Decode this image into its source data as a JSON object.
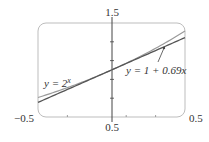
{
  "chart_data": {
    "type": "line",
    "title": "",
    "xlabel": "",
    "ylabel": "",
    "xlim": [
      -0.5,
      0.5
    ],
    "ylim": [
      0.5,
      1.5
    ],
    "grid": false,
    "tick_labels": {
      "x_left": "−0.5",
      "x_right": "0.5",
      "y_bottom": "0.5",
      "y_top": "1.5"
    },
    "series": [
      {
        "name": "y = 2^x",
        "function": "2^x",
        "color": "#9a9a9a",
        "x": [
          -0.5,
          -0.25,
          0,
          0.25,
          0.5
        ],
        "values": [
          0.707,
          0.841,
          1.0,
          1.189,
          1.414
        ]
      },
      {
        "name": "y = 1 + 0.69x",
        "function": "1 + 0.69x",
        "color": "#555555",
        "x": [
          -0.5,
          -0.25,
          0,
          0.25,
          0.5
        ],
        "values": [
          0.655,
          0.828,
          1.0,
          1.173,
          1.345
        ]
      }
    ],
    "annotations": [
      {
        "text_prefix": "y = 2",
        "superscript": "x",
        "target_series": "y = 2^x"
      },
      {
        "text": "y = 1 + 0.69x",
        "target_series": "y = 1 + 0.69x",
        "has_leader_line": true
      }
    ]
  },
  "colors": {
    "frame": "#bdbdbd",
    "axis": "#444444",
    "curve_exp": "#9a9a9a",
    "curve_linear": "#555555"
  }
}
